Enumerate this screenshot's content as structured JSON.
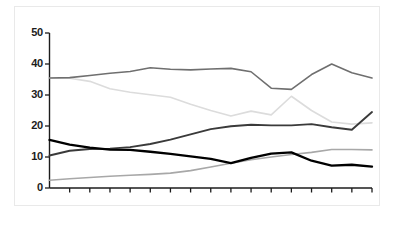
{
  "figure": {
    "background_color": "#ffffff",
    "frame_color": "#e9e9e9",
    "caption": ""
  },
  "axis": {
    "y_tick_labels": [
      "50",
      "40",
      "30",
      "20",
      "10",
      "0"
    ],
    "axis_color": "#1c1c1c"
  },
  "chart_data": {
    "type": "line",
    "title": "",
    "xlabel": "",
    "ylabel": "",
    "ylim": [
      0,
      50
    ],
    "xlim": [
      0,
      16
    ],
    "grid": false,
    "legend": "none",
    "y_ticks": [
      0,
      10,
      20,
      30,
      40,
      50
    ],
    "x": [
      0,
      1,
      2,
      3,
      4,
      5,
      6,
      7,
      8,
      9,
      10,
      11,
      12,
      13,
      14,
      15,
      16
    ],
    "series": [
      {
        "name": "series-1-gray-top",
        "color": "#6f6f6f",
        "width": 1.6,
        "values": [
          35.5,
          35.6,
          36.3,
          37.0,
          37.6,
          38.8,
          38.3,
          38.1,
          38.4,
          38.6,
          37.5,
          32.2,
          31.8,
          36.6,
          40.0,
          37.2,
          35.5
        ]
      },
      {
        "name": "series-2-light-gray",
        "color": "#dcdcdc",
        "width": 1.6,
        "values": [
          35.5,
          35.4,
          34.4,
          32.0,
          30.9,
          30.1,
          29.3,
          27.0,
          25.0,
          23.2,
          24.8,
          23.6,
          29.6,
          25.0,
          21.3,
          20.6,
          21.0
        ]
      },
      {
        "name": "series-3-dark-rising",
        "color": "#3a3a3a",
        "width": 1.9,
        "values": [
          10.5,
          12.0,
          12.6,
          12.7,
          13.2,
          14.2,
          15.6,
          17.3,
          19.0,
          19.9,
          20.4,
          20.2,
          20.2,
          20.6,
          19.6,
          18.8,
          24.5
        ]
      },
      {
        "name": "series-4-black-falling",
        "color": "#000000",
        "width": 2.3,
        "values": [
          15.5,
          14.0,
          13.0,
          12.4,
          12.3,
          11.7,
          11.0,
          10.2,
          9.4,
          8.0,
          9.7,
          11.1,
          11.5,
          8.8,
          7.2,
          7.5,
          6.9
        ]
      },
      {
        "name": "series-5-gray-bottom",
        "color": "#a8a8a8",
        "width": 1.6,
        "values": [
          2.5,
          3.0,
          3.4,
          3.8,
          4.1,
          4.4,
          4.8,
          5.6,
          6.8,
          8.0,
          9.1,
          10.0,
          10.8,
          11.5,
          12.4,
          12.4,
          12.3
        ]
      }
    ]
  }
}
